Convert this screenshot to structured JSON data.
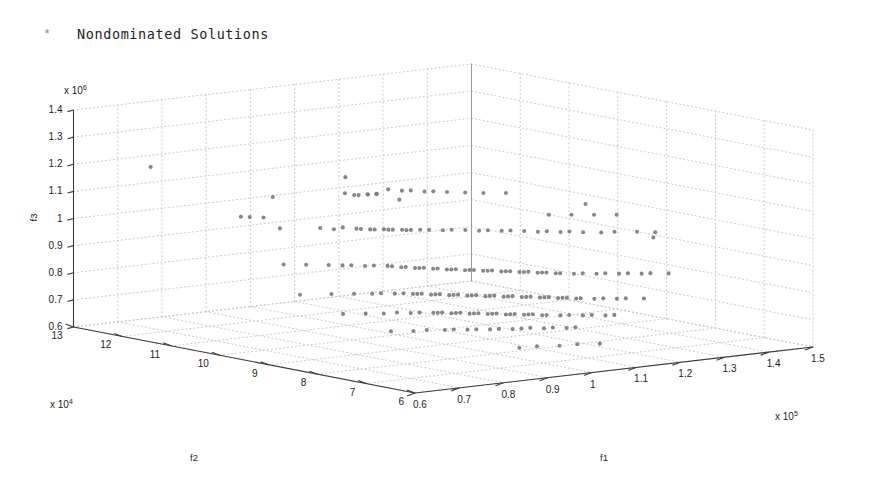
{
  "legend": {
    "marker": "*",
    "marker_icon": "asterisk-marker-icon",
    "label": "Nondominated Solutions",
    "marker_color": "#8e8e8e"
  },
  "axes": {
    "z": {
      "name": "f3",
      "multiplier_prefix": "x 10",
      "multiplier_exponent": "6",
      "ticks": [
        "1.4",
        "1.3",
        "1.2",
        "1.1",
        "1",
        "0.9",
        "0.8",
        "0.7",
        "0.6"
      ],
      "min": 0.6,
      "max": 1.4
    },
    "y": {
      "name": "f2",
      "multiplier_prefix": "x 10",
      "multiplier_exponent": "4",
      "ticks": [
        "13",
        "12",
        "11",
        "10",
        "9",
        "8",
        "7",
        "6"
      ],
      "min": 6,
      "max": 13
    },
    "x": {
      "name": "f1",
      "multiplier_prefix": "x 10",
      "multiplier_exponent": "5",
      "ticks": [
        "0.6",
        "0.7",
        "0.8",
        "0.9",
        "1",
        "1.1",
        "1.2",
        "1.3",
        "1.4",
        "1.5"
      ],
      "min": 0.6,
      "max": 1.5
    }
  },
  "style": {
    "background": "#ffffff",
    "axis_line": "#3c3c3c",
    "grid_dot": "#c8c8c8",
    "marker_color": "#7d7d7d"
  },
  "chart_data": {
    "type": "scatter",
    "title": "",
    "subtitle": "",
    "xlabel": "f1",
    "ylabel": "f2",
    "zlabel": "f3",
    "grid": true,
    "legend_position": "top-left",
    "legend_entries": [
      "Nondominated Solutions"
    ],
    "x_unit": "x 10^5",
    "y_unit": "x 10^4",
    "z_unit": "x 10^6",
    "xlim": [
      0.6,
      1.5
    ],
    "ylim": [
      6,
      13
    ],
    "zlim": [
      0.6,
      1.4
    ],
    "x_ticks": [
      0.6,
      0.7,
      0.8,
      0.9,
      1.0,
      1.1,
      1.2,
      1.3,
      1.4,
      1.5
    ],
    "y_ticks": [
      13,
      12,
      11,
      10,
      9,
      8,
      7,
      6
    ],
    "z_ticks": [
      0.6,
      0.7,
      0.8,
      0.9,
      1.0,
      1.1,
      1.2,
      1.3,
      1.4
    ],
    "series": [
      {
        "name": "Nondominated Solutions",
        "marker": "*",
        "color": "#7d7d7d",
        "points": [
          [
            0.62,
            11.6,
            1.235
          ],
          [
            0.83,
            11.0,
            1.105
          ],
          [
            0.95,
            10.6,
            1.17
          ],
          [
            0.96,
            10.7,
            1.105
          ],
          [
            0.97,
            10.6,
            1.1
          ],
          [
            0.98,
            10.6,
            1.098
          ],
          [
            0.99,
            10.5,
            1.102
          ],
          [
            1.0,
            10.6,
            1.097
          ],
          [
            1.01,
            10.5,
            1.1
          ],
          [
            1.02,
            10.6,
            1.095
          ],
          [
            1.05,
            10.4,
            1.075
          ],
          [
            0.78,
            10.4,
            1.02
          ],
          [
            0.86,
            10.3,
            1.01
          ],
          [
            0.88,
            10.2,
            1.005
          ],
          [
            0.9,
            10.2,
            1.008
          ],
          [
            0.92,
            10.1,
            1.003
          ],
          [
            0.93,
            10.1,
            1.0
          ],
          [
            0.94,
            10.0,
            1.0
          ],
          [
            0.95,
            10.0,
            0.998
          ],
          [
            0.96,
            9.9,
            1.0
          ],
          [
            0.97,
            9.9,
            0.997
          ],
          [
            0.98,
            9.9,
            0.995
          ],
          [
            0.99,
            9.8,
            0.996
          ],
          [
            1.0,
            9.8,
            0.993
          ],
          [
            1.01,
            9.8,
            0.992
          ],
          [
            1.02,
            9.7,
            0.994
          ],
          [
            1.04,
            9.7,
            0.99
          ],
          [
            1.06,
            9.6,
            0.988
          ],
          [
            1.08,
            9.6,
            0.986
          ],
          [
            1.1,
            9.5,
            0.985
          ],
          [
            1.12,
            9.4,
            0.982
          ],
          [
            1.14,
            9.4,
            0.98
          ],
          [
            1.16,
            9.3,
            0.978
          ],
          [
            1.18,
            9.3,
            0.975
          ],
          [
            1.2,
            9.2,
            0.973
          ],
          [
            1.22,
            9.1,
            0.97
          ],
          [
            1.24,
            9.1,
            0.968
          ],
          [
            1.26,
            9.0,
            0.965
          ],
          [
            1.28,
            9.0,
            0.963
          ],
          [
            1.3,
            8.9,
            0.96
          ],
          [
            1.33,
            8.8,
            0.957
          ],
          [
            1.36,
            8.8,
            0.954
          ],
          [
            1.4,
            8.7,
            0.95
          ],
          [
            1.43,
            8.6,
            0.946
          ],
          [
            0.7,
            9.6,
            0.93
          ],
          [
            0.74,
            9.5,
            0.925
          ],
          [
            0.78,
            9.4,
            0.92
          ],
          [
            0.8,
            9.3,
            0.918
          ],
          [
            0.82,
            9.3,
            0.915
          ],
          [
            0.84,
            9.2,
            0.912
          ],
          [
            0.86,
            9.2,
            0.91
          ],
          [
            0.88,
            9.1,
            0.908
          ],
          [
            0.89,
            9.1,
            0.905
          ],
          [
            0.9,
            9.0,
            0.903
          ],
          [
            0.91,
            9.0,
            0.902
          ],
          [
            0.92,
            8.9,
            0.9
          ],
          [
            0.93,
            8.9,
            0.898
          ],
          [
            0.94,
            8.9,
            0.897
          ],
          [
            0.95,
            8.8,
            0.895
          ],
          [
            0.96,
            8.8,
            0.894
          ],
          [
            0.97,
            8.7,
            0.892
          ],
          [
            0.98,
            8.7,
            0.89
          ],
          [
            0.99,
            8.7,
            0.889
          ],
          [
            1.0,
            8.6,
            0.887
          ],
          [
            1.01,
            8.6,
            0.886
          ],
          [
            1.02,
            8.6,
            0.884
          ],
          [
            1.03,
            8.5,
            0.883
          ],
          [
            1.04,
            8.5,
            0.881
          ],
          [
            1.05,
            8.5,
            0.88
          ],
          [
            1.06,
            8.4,
            0.878
          ],
          [
            1.07,
            8.4,
            0.877
          ],
          [
            1.08,
            8.4,
            0.875
          ],
          [
            1.09,
            8.3,
            0.874
          ],
          [
            1.1,
            8.3,
            0.872
          ],
          [
            1.11,
            8.3,
            0.871
          ],
          [
            1.12,
            8.2,
            0.869
          ],
          [
            1.13,
            8.2,
            0.868
          ],
          [
            1.14,
            8.2,
            0.866
          ],
          [
            1.15,
            8.1,
            0.865
          ],
          [
            1.16,
            8.1,
            0.863
          ],
          [
            1.18,
            8.0,
            0.861
          ],
          [
            1.2,
            8.0,
            0.859
          ],
          [
            1.22,
            7.9,
            0.857
          ],
          [
            1.24,
            7.9,
            0.855
          ],
          [
            1.26,
            7.8,
            0.853
          ],
          [
            1.28,
            7.8,
            0.851
          ],
          [
            1.3,
            7.7,
            0.849
          ],
          [
            1.32,
            7.7,
            0.847
          ],
          [
            1.35,
            7.6,
            0.844
          ],
          [
            0.66,
            8.9,
            0.85
          ],
          [
            0.72,
            8.8,
            0.845
          ],
          [
            0.76,
            8.7,
            0.842
          ],
          [
            0.79,
            8.6,
            0.84
          ],
          [
            0.81,
            8.6,
            0.838
          ],
          [
            0.83,
            8.5,
            0.836
          ],
          [
            0.85,
            8.5,
            0.834
          ],
          [
            0.86,
            8.4,
            0.833
          ],
          [
            0.87,
            8.4,
            0.831
          ],
          [
            0.88,
            8.4,
            0.83
          ],
          [
            0.89,
            8.3,
            0.828
          ],
          [
            0.9,
            8.3,
            0.827
          ],
          [
            0.91,
            8.3,
            0.826
          ],
          [
            0.92,
            8.2,
            0.824
          ],
          [
            0.93,
            8.2,
            0.823
          ],
          [
            0.94,
            8.2,
            0.822
          ],
          [
            0.95,
            8.1,
            0.82
          ],
          [
            0.96,
            8.1,
            0.819
          ],
          [
            0.97,
            8.1,
            0.818
          ],
          [
            0.98,
            8.0,
            0.816
          ],
          [
            0.99,
            8.0,
            0.815
          ],
          [
            1.0,
            8.0,
            0.814
          ],
          [
            1.01,
            7.9,
            0.812
          ],
          [
            1.02,
            7.9,
            0.811
          ],
          [
            1.03,
            7.9,
            0.81
          ],
          [
            1.04,
            7.8,
            0.808
          ],
          [
            1.05,
            7.8,
            0.807
          ],
          [
            1.06,
            7.8,
            0.806
          ],
          [
            1.07,
            7.7,
            0.804
          ],
          [
            1.08,
            7.7,
            0.803
          ],
          [
            1.09,
            7.7,
            0.802
          ],
          [
            1.1,
            7.6,
            0.8
          ],
          [
            1.11,
            7.6,
            0.799
          ],
          [
            1.12,
            7.6,
            0.798
          ],
          [
            1.13,
            7.5,
            0.796
          ],
          [
            1.14,
            7.5,
            0.795
          ],
          [
            1.16,
            7.4,
            0.793
          ],
          [
            1.18,
            7.4,
            0.791
          ],
          [
            1.2,
            7.3,
            0.789
          ],
          [
            1.22,
            7.3,
            0.787
          ],
          [
            1.25,
            7.2,
            0.784
          ],
          [
            0.68,
            8.2,
            0.8
          ],
          [
            0.72,
            8.1,
            0.797
          ],
          [
            0.75,
            8.0,
            0.795
          ],
          [
            0.78,
            8.0,
            0.793
          ],
          [
            0.8,
            7.9,
            0.791
          ],
          [
            0.82,
            7.9,
            0.789
          ],
          [
            0.84,
            7.8,
            0.788
          ],
          [
            0.85,
            7.8,
            0.786
          ],
          [
            0.86,
            7.8,
            0.785
          ],
          [
            0.87,
            7.7,
            0.784
          ],
          [
            0.88,
            7.7,
            0.783
          ],
          [
            0.89,
            7.7,
            0.782
          ],
          [
            0.9,
            7.6,
            0.78
          ],
          [
            0.91,
            7.6,
            0.779
          ],
          [
            0.92,
            7.6,
            0.778
          ],
          [
            0.93,
            7.5,
            0.777
          ],
          [
            0.94,
            7.5,
            0.776
          ],
          [
            0.95,
            7.5,
            0.775
          ],
          [
            0.96,
            7.4,
            0.773
          ],
          [
            0.97,
            7.4,
            0.772
          ],
          [
            0.98,
            7.4,
            0.771
          ],
          [
            0.99,
            7.3,
            0.77
          ],
          [
            1.0,
            7.3,
            0.769
          ],
          [
            1.01,
            7.3,
            0.768
          ],
          [
            1.02,
            7.2,
            0.766
          ],
          [
            1.03,
            7.2,
            0.765
          ],
          [
            1.05,
            7.1,
            0.763
          ],
          [
            1.07,
            7.1,
            0.761
          ],
          [
            1.09,
            7.0,
            0.759
          ],
          [
            1.11,
            7.0,
            0.757
          ],
          [
            1.13,
            6.9,
            0.755
          ],
          [
            1.15,
            6.9,
            0.753
          ],
          [
            0.7,
            7.4,
            0.76
          ],
          [
            0.74,
            7.3,
            0.757
          ],
          [
            0.77,
            7.3,
            0.755
          ],
          [
            0.8,
            7.2,
            0.753
          ],
          [
            0.82,
            7.2,
            0.751
          ],
          [
            0.84,
            7.1,
            0.75
          ],
          [
            0.86,
            7.1,
            0.748
          ],
          [
            0.88,
            7.0,
            0.747
          ],
          [
            0.9,
            7.0,
            0.745
          ],
          [
            0.92,
            6.9,
            0.744
          ],
          [
            0.94,
            6.9,
            0.742
          ],
          [
            0.96,
            6.9,
            0.741
          ],
          [
            0.98,
            6.8,
            0.739
          ],
          [
            1.0,
            6.8,
            0.738
          ],
          [
            1.02,
            6.7,
            0.736
          ],
          [
            1.04,
            6.7,
            0.735
          ],
          [
            0.88,
            6.4,
            0.7
          ],
          [
            0.92,
            6.4,
            0.698
          ],
          [
            0.96,
            6.3,
            0.696
          ],
          [
            1.0,
            6.3,
            0.694
          ],
          [
            1.04,
            6.2,
            0.692
          ],
          [
            1.3,
            9.6,
            1.0
          ],
          [
            1.34,
            9.5,
            0.996
          ],
          [
            1.38,
            9.4,
            0.992
          ],
          [
            1.42,
            9.3,
            0.988
          ],
          [
            1.46,
            10.3,
            0.985
          ],
          [
            1.47,
            9.0,
            0.905
          ],
          [
            0.78,
            11.2,
            1.035
          ],
          [
            0.8,
            11.2,
            1.03
          ],
          [
            0.82,
            11.1,
            1.028
          ],
          [
            1.08,
            10.9,
            1.09
          ],
          [
            1.1,
            10.8,
            1.085
          ],
          [
            1.12,
            10.8,
            1.082
          ],
          [
            1.14,
            10.7,
            1.078
          ],
          [
            1.16,
            10.7,
            1.075
          ],
          [
            1.18,
            10.6,
            1.072
          ],
          [
            1.21,
            10.5,
            1.068
          ],
          [
            1.24,
            10.4,
            1.064
          ],
          [
            1.28,
            10.3,
            1.06
          ]
        ]
      }
    ]
  }
}
